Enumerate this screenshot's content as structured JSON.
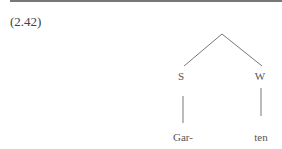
{
  "example": {
    "number": "(2.42)"
  },
  "tree": {
    "nodes": {
      "left_label": "S",
      "right_label": "W"
    },
    "leaves": {
      "left": "Gar-",
      "right": "ten"
    }
  },
  "colors": {
    "line": "#777777",
    "text": "#444444"
  }
}
